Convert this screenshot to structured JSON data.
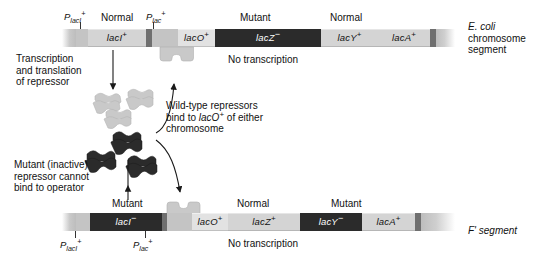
{
  "diagram": {
    "ecoli_label_line1": "E. coli",
    "ecoli_label_line2": "chromosome",
    "ecoli_label_line3": "segment",
    "f_label": "F' segment",
    "no_transcription_top": "No transcription",
    "no_transcription_bottom": "No transcription"
  },
  "annotations": {
    "transcription": [
      "Transcription",
      "and translation",
      "of repressor"
    ],
    "wildtype": [
      "Wild-type repressors",
      "bind to lacO+ of either",
      "chromosome"
    ],
    "wildtype_line2_pre": "bind to ",
    "wildtype_line2_gene": "lacO",
    "wildtype_line2_sup": "+",
    "wildtype_line2_post": " of either",
    "mutant": [
      "Mutant (inactive)",
      "repressor cannot",
      "bind to operator"
    ]
  },
  "chromosome_top": {
    "name": "E. coli chromosome segment",
    "promoters": [
      {
        "label_p": "P",
        "label_sub": "lacI",
        "label_sup": "+",
        "x": 80
      },
      {
        "label_p": "P",
        "label_sub": "lac",
        "label_sup": "+",
        "x": 136
      }
    ],
    "genes": [
      {
        "name": "lacI",
        "sup": "+",
        "state": "Normal",
        "type": "normal"
      },
      {
        "name": "lacO",
        "sup": "+",
        "state": "",
        "type": "operator"
      },
      {
        "name": "lacZ",
        "sup": "−",
        "state": "Mutant",
        "type": "mutant"
      },
      {
        "name": "lacY",
        "sup": "+",
        "state": "Normal",
        "type": "normal"
      },
      {
        "name": "lacA",
        "sup": "+",
        "state": "",
        "type": "normal"
      }
    ]
  },
  "chromosome_bottom": {
    "name": "F' segment",
    "promoters": [
      {
        "label_p": "P",
        "label_sub": "lacI",
        "label_sup": "+",
        "x": 75
      },
      {
        "label_p": "P",
        "label_sub": "lac",
        "label_sup": "+",
        "x": 145
      }
    ],
    "genes": [
      {
        "name": "lacI",
        "sup": "−",
        "state": "Mutant",
        "type": "mutant"
      },
      {
        "name": "lacO",
        "sup": "+",
        "state": "",
        "type": "operator"
      },
      {
        "name": "lacZ",
        "sup": "+",
        "state": "Normal",
        "type": "normal"
      },
      {
        "name": "lacY",
        "sup": "−",
        "state": "Mutant",
        "type": "mutant"
      },
      {
        "name": "lacA",
        "sup": "+",
        "state": "",
        "type": "normal"
      }
    ]
  },
  "repressors": {
    "wild_type_count": 3,
    "mutant_count": 3,
    "wild_type_color": "#c9c9c9",
    "mutant_color": "#2b2b2b"
  },
  "colors": {
    "mutant_gene": "#2b2b2b",
    "normal_gene": "#d4d4d4",
    "operator": "#e2e2e2",
    "backbone": "#c4c4c4",
    "text": "#111111"
  }
}
